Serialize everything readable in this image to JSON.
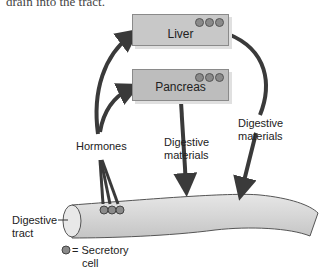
{
  "top_text": "drain into the tract.",
  "organs": [
    {
      "name": "Liver"
    },
    {
      "name": "Pancreas"
    }
  ],
  "labels": {
    "hormones": "Hormones",
    "digestive_materials_1": [
      "Digestive",
      "materials"
    ],
    "digestive_materials_2": [
      "Digestive",
      "materials"
    ],
    "digestive_tract": [
      "Digestive",
      "tract"
    ],
    "legend_symbol": "= Secretory",
    "legend_cont": "cell"
  },
  "colors": {
    "organ_fill": "#c8c8c8",
    "arrow": "#3a3a3a",
    "tract_fill": "#d9d9d9",
    "secretory_cell": "#8a8a8a"
  }
}
